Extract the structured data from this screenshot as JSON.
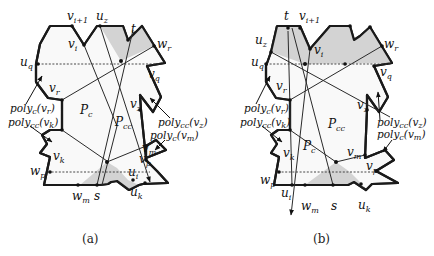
{
  "figures": [
    {
      "id": "a",
      "caption": "(a)",
      "labels": {
        "v_i1": "v",
        "v_i1_sub": "i+1",
        "u_z": "u",
        "u_z_sub": "z",
        "t": "t",
        "v_i": "v",
        "v_i_sub": "i",
        "w_r": "w",
        "w_r_sub": "r",
        "u_q": "u",
        "u_q_sub": "q",
        "v_q": "v",
        "v_q_sub": "q",
        "v_r": "v",
        "v_r_sub": "r",
        "P_c": "P",
        "P_c_sub": "c",
        "P_cc": "P",
        "P_cc_sub": "cc",
        "v_z": "v",
        "v_z_sub": "z",
        "poly_c_vr": "poly",
        "poly_c_vr_sub": "c",
        "poly_c_vr_arg": "(v",
        "poly_c_vr_arg_sub": "r",
        "poly_c_vr_close": ")",
        "poly_cc_vk": "poly",
        "poly_cc_vk_sub": "cc",
        "poly_cc_vk_arg": "(v",
        "poly_cc_vk_arg_sub": "k",
        "poly_cc_vk_close": ")",
        "poly_cc_vz": "poly",
        "poly_cc_vz_sub": "cc",
        "poly_cc_vz_arg": "(v",
        "poly_cc_vz_arg_sub": "z",
        "poly_cc_vz_close": ")",
        "poly_c_vm": "poly",
        "poly_c_vm_sub": "c",
        "poly_c_vm_arg": "(v",
        "poly_c_vm_arg_sub": "m",
        "poly_c_vm_close": ")",
        "v_k": "v",
        "v_k_sub": "k",
        "v_m": "v",
        "v_m_sub": "m",
        "v_p": "v",
        "v_p_sub": "p",
        "w_p": "w",
        "w_p_sub": "p",
        "u_i": "u",
        "u_i_sub": "i",
        "u_k": "u",
        "u_k_sub": "k",
        "w_m": "w",
        "w_m_sub": "m",
        "s": "s"
      }
    },
    {
      "id": "b",
      "caption": "(b)",
      "labels": {
        "t": "t",
        "v_i1": "v",
        "v_i1_sub": "i+1",
        "u_z": "u",
        "u_z_sub": "z",
        "v_i": "v",
        "v_i_sub": "i",
        "w_r": "w",
        "w_r_sub": "r",
        "u_q": "u",
        "u_q_sub": "q",
        "v_q": "v",
        "v_q_sub": "q",
        "v_r": "v",
        "v_r_sub": "r",
        "v_z": "v",
        "v_z_sub": "z",
        "P_cc": "P",
        "P_cc_sub": "cc",
        "P_c": "P",
        "P_c_sub": "c",
        "poly_c_vr": "poly",
        "poly_c_vr_sub": "c",
        "poly_c_vr_arg": "(v",
        "poly_c_vr_arg_sub": "r",
        "poly_c_vr_close": ")",
        "poly_cc_vk": "poly",
        "poly_cc_vk_sub": "cc",
        "poly_cc_vk_arg": "(v",
        "poly_cc_vk_arg_sub": "k",
        "poly_cc_vk_close": ")",
        "poly_cc_vz": "poly",
        "poly_cc_vz_sub": "cc",
        "poly_cc_vz_arg": "(v",
        "poly_cc_vz_arg_sub": "z",
        "poly_cc_vz_close": ")",
        "poly_c_vm": "poly",
        "poly_c_vm_sub": "c",
        "poly_c_vm_arg": "(v",
        "poly_c_vm_arg_sub": "m",
        "poly_c_vm_close": ")",
        "v_k": "v",
        "v_k_sub": "k",
        "v_m": "v",
        "v_m_sub": "m",
        "v_p": "v",
        "v_p_sub": "p",
        "w_p": "w",
        "w_p_sub": "p",
        "u_i": "u",
        "u_i_sub": "i",
        "w_m": "w",
        "w_m_sub": "m",
        "s": "s",
        "u_k": "u",
        "u_k_sub": "k"
      }
    }
  ],
  "colors": {
    "shade": "#d3d3d3",
    "polygon_fill": "#f9f9f9",
    "stroke": "#1a1a1a"
  }
}
